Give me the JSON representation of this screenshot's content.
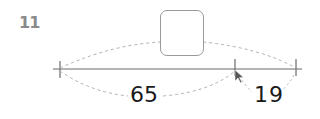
{
  "problem": {
    "number": "11",
    "left_segment": "65",
    "right_segment": "19",
    "answer_box": ""
  },
  "colors": {
    "number": "#8a8a8a",
    "line": "#6b6b6b",
    "dashed": "#b0b0b0",
    "text": "#1a1a1a"
  }
}
